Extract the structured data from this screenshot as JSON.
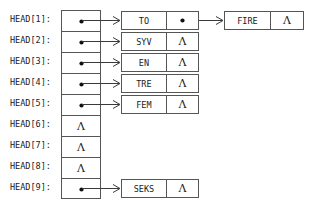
{
  "diagram": {
    "null_symbol": "Λ",
    "pointer_glyph": "pointer-dot",
    "colors": {
      "background": "#ffffff",
      "box_border": "#555555",
      "text": "#1a1a1a",
      "arrow": "#3a3a3a",
      "dot": "#111111"
    },
    "head_array": {
      "name": "HEAD",
      "entries": [
        {
          "label": "HEAD[1]:",
          "kind": "pointer",
          "value": "pointer-dot"
        },
        {
          "label": "HEAD[2]:",
          "kind": "pointer",
          "value": "pointer-dot"
        },
        {
          "label": "HEAD[3]:",
          "kind": "pointer",
          "value": "pointer-dot"
        },
        {
          "label": "HEAD[4]:",
          "kind": "pointer",
          "value": "pointer-dot"
        },
        {
          "label": "HEAD[5]:",
          "kind": "pointer",
          "value": "pointer-dot"
        },
        {
          "label": "HEAD[6]:",
          "kind": "null",
          "value": "Λ"
        },
        {
          "label": "HEAD[7]:",
          "kind": "null",
          "value": "Λ"
        },
        {
          "label": "HEAD[8]:",
          "kind": "null",
          "value": "Λ"
        },
        {
          "label": "HEAD[9]:",
          "kind": "pointer",
          "value": "pointer-dot"
        }
      ]
    },
    "lists": [
      {
        "head_index": 1,
        "nodes": [
          {
            "data": "TO",
            "link_kind": "pointer",
            "link_value": "pointer-dot"
          },
          {
            "data": "FIRE",
            "link_kind": "null",
            "link_value": "Λ"
          }
        ]
      },
      {
        "head_index": 2,
        "nodes": [
          {
            "data": "SYV",
            "link_kind": "null",
            "link_value": "Λ"
          }
        ]
      },
      {
        "head_index": 3,
        "nodes": [
          {
            "data": "EN",
            "link_kind": "null",
            "link_value": "Λ"
          }
        ]
      },
      {
        "head_index": 4,
        "nodes": [
          {
            "data": "TRE",
            "link_kind": "null",
            "link_value": "Λ"
          }
        ]
      },
      {
        "head_index": 5,
        "nodes": [
          {
            "data": "FEM",
            "link_kind": "null",
            "link_value": "Λ"
          }
        ]
      },
      {
        "head_index": 9,
        "nodes": [
          {
            "data": "SEKS",
            "link_kind": "null",
            "link_value": "Λ"
          }
        ]
      }
    ]
  }
}
